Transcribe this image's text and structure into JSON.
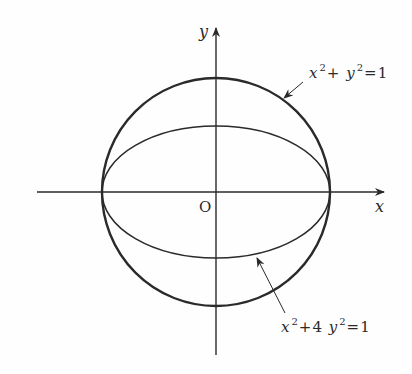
{
  "figure": {
    "origin_label": "O",
    "x_axis_label": "x",
    "y_axis_label": "y",
    "curves": [
      {
        "name": "circle",
        "equation_parts": [
          "x",
          "2",
          "+",
          "y",
          "2",
          "=1"
        ],
        "equation": "x²+y²=1"
      },
      {
        "name": "ellipse",
        "equation_parts": [
          "x",
          "2",
          "+4",
          "y",
          "2",
          "=1"
        ],
        "equation": "x²+4y²=1"
      }
    ],
    "colors": {
      "stroke": "#2a2a2a",
      "background": "#fefefe"
    }
  }
}
